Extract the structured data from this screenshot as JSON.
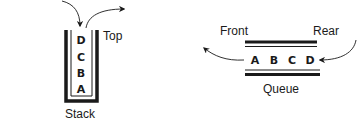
{
  "stack": {
    "label": "Stack",
    "top_label": "Top",
    "items": [
      "D",
      "C",
      "B",
      "A"
    ],
    "push_arrow": "arrow-in",
    "pop_arrow": "arrow-out"
  },
  "queue": {
    "label": "Queue",
    "front_label": "Front",
    "rear_label": "Rear",
    "items": [
      "A",
      "B",
      "C",
      "D"
    ],
    "enqueue_arrow": "arrow-in",
    "dequeue_arrow": "arrow-out"
  },
  "colors": {
    "ink": "#1a1a1a",
    "background": "#ffffff"
  }
}
